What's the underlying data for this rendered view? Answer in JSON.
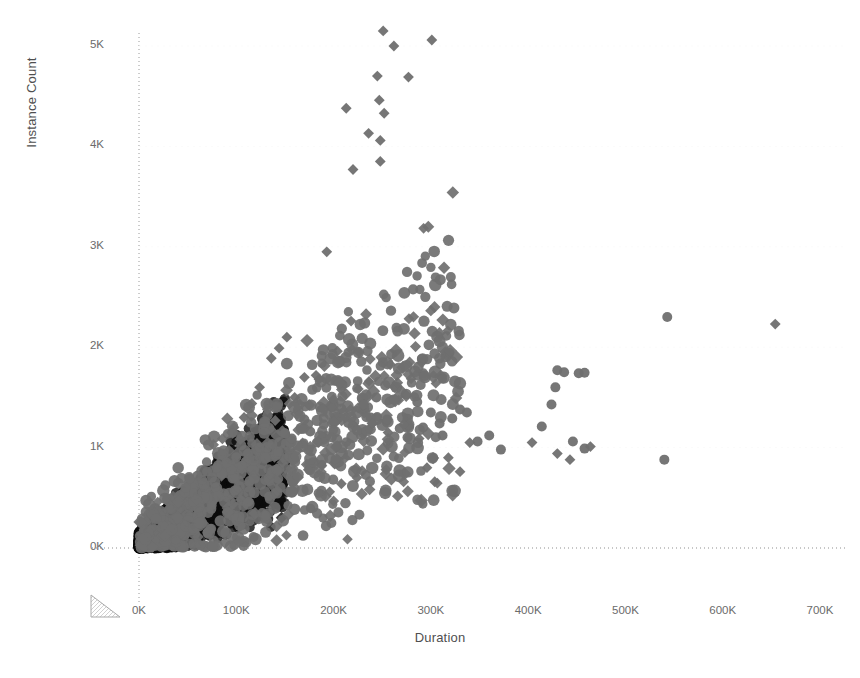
{
  "chart_data": {
    "type": "scatter",
    "title": "",
    "xlabel": "Duration",
    "ylabel": "Instance Count",
    "xlim": [
      -15000,
      730000
    ],
    "ylim": [
      -180,
      5300
    ],
    "xticks": [
      0,
      100000,
      200000,
      300000,
      400000,
      500000,
      600000,
      700000
    ],
    "xticklabels": [
      "0K",
      "100K",
      "200K",
      "300K",
      "400K",
      "500K",
      "600K",
      "700K"
    ],
    "yticks": [
      0,
      1000,
      2000,
      3000,
      4000,
      5000
    ],
    "yticklabels": [
      "0K",
      "1K",
      "2K",
      "3K",
      "4K",
      "5K"
    ],
    "grid": "dotted-zero-lines",
    "legend": "none",
    "marker_color": "#6f6f6f",
    "dense_core_color": "#0b0b0b",
    "marker_shapes": [
      "circle",
      "diamond"
    ],
    "series": [
      {
        "name": "circle-markers",
        "shape": "circle",
        "points": [
          [
            430000,
            1770
          ],
          [
            437000,
            1750
          ],
          [
            452000,
            1740
          ],
          [
            458000,
            1745
          ],
          [
            428000,
            1600
          ],
          [
            424000,
            1430
          ],
          [
            414000,
            1210
          ],
          [
            330000,
            1380
          ],
          [
            337000,
            1350
          ],
          [
            322000,
            1290
          ],
          [
            300000,
            1350
          ],
          [
            309000,
            1240
          ],
          [
            312000,
            1120
          ],
          [
            286000,
            1455
          ],
          [
            292000,
            1200
          ],
          [
            276000,
            1100
          ],
          [
            262000,
            1480
          ],
          [
            268000,
            1190
          ],
          [
            255000,
            1280
          ],
          [
            244000,
            1500
          ],
          [
            238000,
            1300
          ],
          [
            231000,
            1430
          ],
          [
            224000,
            1170
          ],
          [
            215000,
            1245
          ],
          [
            208000,
            1390
          ],
          [
            198000,
            1100
          ],
          [
            190000,
            1230
          ],
          [
            183000,
            1050
          ],
          [
            176000,
            1160
          ],
          [
            170000,
            1280
          ],
          [
            163000,
            1020
          ],
          [
            157000,
            1090
          ],
          [
            150000,
            1140
          ],
          [
            143000,
            960
          ],
          [
            137000,
            1035
          ],
          [
            130000,
            900
          ],
          [
            124000,
            1000
          ],
          [
            118000,
            870
          ],
          [
            112000,
            940
          ],
          [
            106000,
            820
          ],
          [
            100000,
            905
          ],
          [
            95000,
            780
          ],
          [
            90000,
            850
          ],
          [
            85000,
            740
          ],
          [
            80000,
            800
          ],
          [
            75000,
            700
          ],
          [
            70000,
            760
          ],
          [
            65000,
            680
          ],
          [
            60000,
            720
          ],
          [
            56000,
            640
          ],
          [
            52000,
            690
          ],
          [
            48000,
            600
          ],
          [
            360000,
            1120
          ],
          [
            372000,
            980
          ],
          [
            348000,
            1060
          ],
          [
            458000,
            990
          ],
          [
            446000,
            1060
          ],
          [
            540000,
            880
          ],
          [
            543000,
            2300
          ]
        ]
      },
      {
        "name": "diamond-markers",
        "shape": "diamond",
        "points": [
          [
            251000,
            5150
          ],
          [
            262000,
            5000
          ],
          [
            301000,
            5060
          ],
          [
            245000,
            4700
          ],
          [
            277000,
            4690
          ],
          [
            213000,
            4380
          ],
          [
            247000,
            4460
          ],
          [
            252000,
            4330
          ],
          [
            236000,
            4130
          ],
          [
            248000,
            4060
          ],
          [
            248000,
            3850
          ],
          [
            220000,
            3770
          ],
          [
            193000,
            2950
          ],
          [
            218000,
            2260
          ],
          [
            226000,
            1950
          ],
          [
            204000,
            1960
          ],
          [
            654000,
            2230
          ],
          [
            136000,
            1890
          ],
          [
            124000,
            1600
          ],
          [
            170000,
            1700
          ],
          [
            144000,
            1990
          ],
          [
            152000,
            2100
          ],
          [
            182000,
            1720
          ],
          [
            185000,
            1680
          ],
          [
            116000,
            1440
          ],
          [
            132000,
            1380
          ],
          [
            160000,
            1500
          ],
          [
            140000,
            1270
          ],
          [
            108000,
            1300
          ],
          [
            200000,
            1480
          ],
          [
            212000,
            1300
          ],
          [
            240000,
            1240
          ],
          [
            256000,
            1150
          ],
          [
            272000,
            1230
          ],
          [
            288000,
            1090
          ],
          [
            296000,
            800
          ],
          [
            304000,
            660
          ],
          [
            330000,
            760
          ],
          [
            318000,
            900
          ],
          [
            340000,
            1050
          ],
          [
            404000,
            1050
          ],
          [
            430000,
            940
          ],
          [
            443000,
            880
          ],
          [
            464000,
            1010
          ],
          [
            196000,
            560
          ],
          [
            208000,
            640
          ],
          [
            224000,
            700
          ],
          [
            174000,
            780
          ],
          [
            188000,
            820
          ]
        ]
      }
    ]
  },
  "axes": {
    "y_title": "Instance Count",
    "x_title": "Duration",
    "y_tick_labels": [
      "5K",
      "4K",
      "3K",
      "2K",
      "1K",
      "0K"
    ],
    "x_tick_labels": [
      "0K",
      "100K",
      "200K",
      "300K",
      "400K",
      "500K",
      "600K",
      "700K"
    ]
  },
  "controls": {
    "resize_handle_name": "resize-handle"
  }
}
